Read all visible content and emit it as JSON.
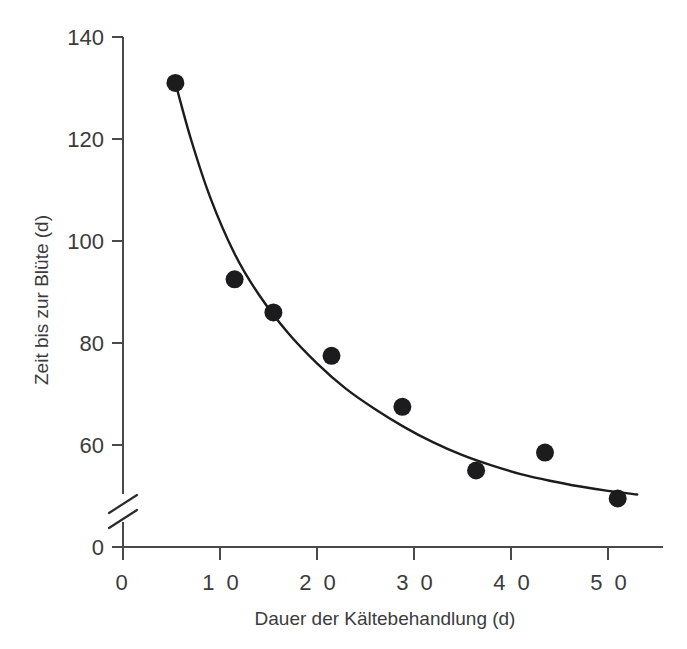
{
  "chart_data": {
    "type": "scatter",
    "title": "",
    "subtitle": "",
    "xlabel": "Dauer der Kältebehandlung (d)",
    "ylabel": "Zeit bis zur Blüte (d)",
    "xlim": [
      0,
      55
    ],
    "ylim": [
      40,
      140
    ],
    "y_axis_break": true,
    "y_axis_break_label": "0",
    "grid": false,
    "legend": null,
    "xticks": [
      0,
      10,
      20,
      30,
      40,
      50
    ],
    "xticklabels": [
      "0",
      "1 0",
      "2 0",
      "3 0",
      "4 0",
      "5 0"
    ],
    "yticks": [
      60,
      80,
      100,
      120,
      140
    ],
    "yticklabels": [
      "60",
      "80",
      "100",
      "120",
      "140"
    ],
    "y_zero_tick_label": "0",
    "x": [
      5.4,
      11.5,
      15.5,
      21.5,
      28.8,
      36.4,
      43.5,
      51.0
    ],
    "y": [
      131.0,
      92.5,
      86.0,
      77.5,
      67.5,
      55.0,
      58.5,
      49.5
    ],
    "points": [
      {
        "x": 5.4,
        "y": 131.0
      },
      {
        "x": 11.5,
        "y": 92.5
      },
      {
        "x": 15.5,
        "y": 86.0
      },
      {
        "x": 21.5,
        "y": 77.5
      },
      {
        "x": 28.8,
        "y": 67.5
      },
      {
        "x": 36.4,
        "y": 55.0
      },
      {
        "x": 43.5,
        "y": 58.5
      },
      {
        "x": 51.0,
        "y": 49.5
      }
    ],
    "fit_curve": {
      "description": "decaying exponential trend line",
      "x": [
        5.4,
        7.0,
        9.0,
        11.5,
        14.0,
        17.0,
        20.0,
        23.0,
        26.0,
        29.0,
        32.0,
        35.0,
        38.0,
        41.0,
        44.0,
        47.0,
        50.0,
        53.0
      ],
      "y": [
        131.0,
        120.0,
        108.5,
        97.5,
        89.5,
        82.0,
        76.0,
        71.0,
        67.0,
        63.5,
        60.5,
        58.0,
        56.0,
        54.3,
        53.0,
        51.9,
        51.0,
        50.3
      ]
    },
    "colors": {
      "point": "#1c1c1e",
      "curve": "#1c1c1e",
      "axis": "#4a4a4c",
      "text": "#3b3b3d",
      "background": "#ffffff"
    }
  }
}
